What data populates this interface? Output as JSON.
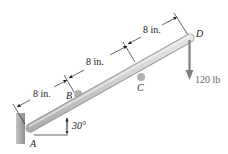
{
  "diagram": {
    "points": {
      "A": "A",
      "B": "B",
      "C": "C",
      "D": "D"
    },
    "dimensions": [
      {
        "label": "8 in.",
        "from": "A",
        "to": "B"
      },
      {
        "label": "8 in.",
        "from": "B",
        "to": "C"
      },
      {
        "label": "8 in.",
        "from": "C",
        "to": "D"
      }
    ],
    "angle": {
      "label": "30°",
      "at": "A",
      "reference": "horizontal"
    },
    "force": {
      "label": "120 lb",
      "at": "D",
      "direction": "down"
    },
    "colors": {
      "beam_fill": "#d9d9d9",
      "beam_edge": "#9a9a9a",
      "wall": "#a8a8a8",
      "pin": "#b0b0b0",
      "force_arrow": "#808080",
      "line": "#222222"
    }
  }
}
